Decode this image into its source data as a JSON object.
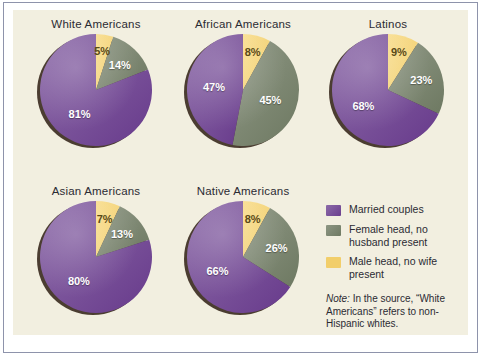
{
  "figure": {
    "panel_bg": "#f2efe0",
    "frame_color": "#8e93ab"
  },
  "colors": {
    "married": "#6b3f8e",
    "married_light": "#8c6aa8",
    "female_head": "#6f7a63",
    "female_head_light": "#8d9683",
    "male_head": "#f2ce6a",
    "shadow": "#3d2e22",
    "label_light": "#ffffff",
    "label_dark": "#5a4a18",
    "text": "#2b2b33"
  },
  "legend": {
    "items": [
      {
        "label": "Married couples",
        "color_key": "married"
      },
      {
        "label": "Female head, no husband present",
        "color_key": "female_head"
      },
      {
        "label": "Male head, no wife present",
        "color_key": "male_head"
      }
    ]
  },
  "note": {
    "prefix": "Note:",
    "text": " In the source, “White Americans” refers to non-Hispanic whites."
  },
  "chart_data": {
    "type": "pie",
    "title": "",
    "legend_position": "right",
    "series_names": [
      "Married couples",
      "Female head, no husband present",
      "Male head, no wife present"
    ],
    "unit": "%",
    "charts": [
      {
        "title": "White Americans",
        "slices": [
          {
            "name": "Male head, no wife present",
            "value": 5,
            "label": "5%"
          },
          {
            "name": "Female head, no husband present",
            "value": 14,
            "label": "14%"
          },
          {
            "name": "Married couples",
            "value": 81,
            "label": "81%"
          }
        ]
      },
      {
        "title": "African Americans",
        "slices": [
          {
            "name": "Male head, no wife present",
            "value": 8,
            "label": "8%"
          },
          {
            "name": "Female head, no husband present",
            "value": 45,
            "label": "45%"
          },
          {
            "name": "Married couples",
            "value": 47,
            "label": "47%"
          }
        ]
      },
      {
        "title": "Latinos",
        "slices": [
          {
            "name": "Male head, no wife present",
            "value": 9,
            "label": "9%"
          },
          {
            "name": "Female head, no husband present",
            "value": 23,
            "label": "23%"
          },
          {
            "name": "Married couples",
            "value": 68,
            "label": "68%"
          }
        ]
      },
      {
        "title": "Asian Americans",
        "slices": [
          {
            "name": "Male head, no wife present",
            "value": 7,
            "label": "7%"
          },
          {
            "name": "Female head, no husband present",
            "value": 13,
            "label": "13%"
          },
          {
            "name": "Married couples",
            "value": 80,
            "label": "80%"
          }
        ]
      },
      {
        "title": "Native Americans",
        "slices": [
          {
            "name": "Male head, no wife present",
            "value": 8,
            "label": "8%"
          },
          {
            "name": "Female head, no husband present",
            "value": 26,
            "label": "26%"
          },
          {
            "name": "Married couples",
            "value": 66,
            "label": "66%"
          }
        ]
      }
    ]
  }
}
